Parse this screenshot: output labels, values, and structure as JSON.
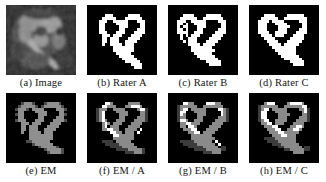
{
  "figure": {
    "rows": 2,
    "columns": 4,
    "background_color": "#ffffff",
    "panel_background_color": "#000000",
    "caption_color": "#141414"
  },
  "panels": [
    {
      "id": "a",
      "label": "(a) Image",
      "name": "panel-image",
      "kind": "grayscale-mri",
      "description": "Noisy grayscale MR image slice of the structure"
    },
    {
      "id": "b",
      "label": "(b) Rater A",
      "name": "panel-rater-a",
      "kind": "binary-mask",
      "description": "Binary expert segmentation by Rater A"
    },
    {
      "id": "c",
      "label": "(c) Rater B",
      "name": "panel-rater-b",
      "kind": "binary-mask",
      "description": "Binary expert segmentation by Rater B"
    },
    {
      "id": "d",
      "label": "(d) Rater C",
      "name": "panel-rater-c",
      "kind": "binary-mask",
      "description": "Binary expert segmentation by Rater C"
    },
    {
      "id": "e",
      "label": "(e) EM",
      "name": "panel-em",
      "kind": "probability-map",
      "description": "EM (STAPLE) estimated consensus probability map"
    },
    {
      "id": "f",
      "label": "(f) EM / A",
      "name": "panel-em-over-a",
      "kind": "overlay",
      "description": "EM estimate overlaid against Rater A"
    },
    {
      "id": "g",
      "label": "(g) EM / B",
      "name": "panel-em-over-b",
      "kind": "overlay",
      "description": "EM estimate overlaid against Rater B"
    },
    {
      "id": "h",
      "label": "(h) EM / C",
      "name": "panel-em-over-c",
      "kind": "overlay",
      "description": "EM estimate overlaid against Rater C"
    }
  ],
  "grayscale_levels": {
    "background": "#000000",
    "low": "#3a3a3a",
    "mid": "#7d7d7d",
    "high": "#b4b4b4",
    "foreground": "#ffffff"
  }
}
